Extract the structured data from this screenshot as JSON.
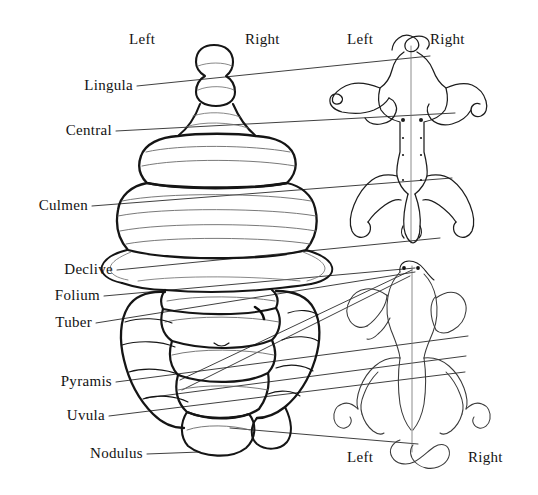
{
  "figure": {
    "background_color": "#ffffff",
    "ink_color": "#131313"
  },
  "orientation_headers": [
    {
      "id": "cerebellum-left",
      "text": "Left",
      "x": 129,
      "y": 32
    },
    {
      "id": "cerebellum-right",
      "text": "Right",
      "x": 245,
      "y": 32
    },
    {
      "id": "upper-homunculus-left",
      "text": "Left",
      "x": 347,
      "y": 32
    },
    {
      "id": "upper-homunculus-right",
      "text": "Right",
      "x": 430,
      "y": 32
    },
    {
      "id": "lower-homunculus-left",
      "text": "Left",
      "x": 347,
      "y": 450
    },
    {
      "id": "lower-homunculus-right",
      "text": "Right",
      "x": 468,
      "y": 450
    }
  ],
  "lobule_labels": [
    {
      "id": "lingula",
      "text": "Lingula",
      "right_x": 133,
      "y": 78
    },
    {
      "id": "central",
      "text": "Central",
      "right_x": 112,
      "y": 123
    },
    {
      "id": "culmen",
      "text": "Culmen",
      "right_x": 88,
      "y": 198
    },
    {
      "id": "declive",
      "text": "Declive",
      "right_x": 113,
      "y": 262
    },
    {
      "id": "folium",
      "text": "Folium",
      "right_x": 100,
      "y": 288
    },
    {
      "id": "tuber",
      "text": "Tuber",
      "right_x": 92,
      "y": 315
    },
    {
      "id": "pyramis",
      "text": "Pyramis",
      "right_x": 112,
      "y": 374
    },
    {
      "id": "uvula",
      "text": "Uvula",
      "right_x": 105,
      "y": 408
    },
    {
      "id": "nodulus",
      "text": "Nodulus",
      "right_x": 143,
      "y": 446
    }
  ]
}
